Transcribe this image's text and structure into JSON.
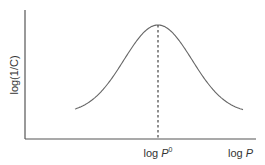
{
  "chart_data": {
    "type": "line",
    "title": "",
    "xlabel": "log P",
    "ylabel": "log(1/C)",
    "x_tick_labels": [
      "log P0"
    ],
    "annotations": [
      {
        "type": "vertical-dashed-line",
        "at": "log P0",
        "description": "optimum lipophilicity at curve peak"
      }
    ],
    "series": [
      {
        "name": "parabolic activity curve",
        "shape": "bell / parabolic",
        "x": [
          -5,
          -4,
          -3,
          -2,
          -1,
          0,
          1,
          2,
          3,
          4,
          5
        ],
        "values": [
          0.12,
          0.25,
          0.45,
          0.7,
          0.92,
          1.0,
          0.92,
          0.7,
          0.45,
          0.25,
          0.12
        ]
      }
    ],
    "grid": false,
    "legend": null,
    "axes_numeric_ticks": false
  },
  "labels": {
    "y_axis": "log(1/C)",
    "x_axis_prefix": "log ",
    "x_axis_var": "P",
    "peak_prefix": "log ",
    "peak_var": "P",
    "peak_sup": "0"
  },
  "colors": {
    "axis": "#555555",
    "curve": "#666666",
    "text": "#333333"
  }
}
